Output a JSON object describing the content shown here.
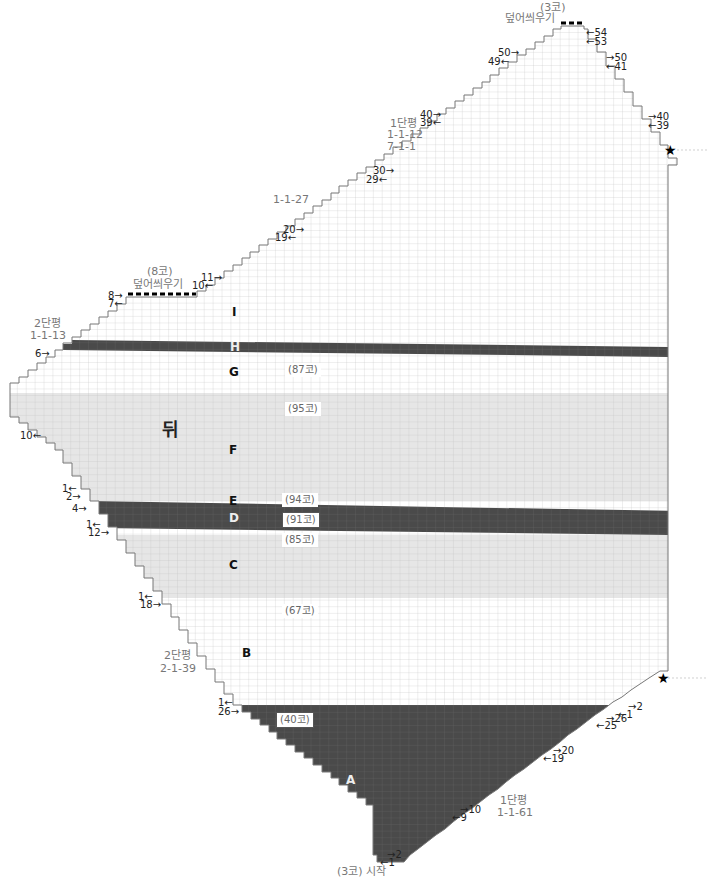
{
  "title": "뒤",
  "chart_data": {
    "type": "knitting-chart",
    "piece": "뒤",
    "start": "(3코) 시작",
    "sections": [
      {
        "id": "A",
        "stitches": "(40코)",
        "color": "#4a4a4a"
      },
      {
        "id": "B",
        "stitches": "(67코)",
        "color": "#ffffff"
      },
      {
        "id": "C",
        "stitches": "(85코)",
        "color": "#e8e8e8"
      },
      {
        "id": "D",
        "stitches": "(91코)",
        "color": "#4a4a4a"
      },
      {
        "id": "E",
        "stitches": "(94코)",
        "color": "#ffffff"
      },
      {
        "id": "F",
        "stitches": "(95코)",
        "color": "#e8e8e8"
      },
      {
        "id": "G",
        "stitches": "(87코)",
        "color": "#ffffff"
      },
      {
        "id": "H",
        "stitches": "",
        "color": "#4a4a4a"
      },
      {
        "id": "I",
        "stitches": "",
        "color": "#ffffff"
      }
    ],
    "shaping_notes": [
      {
        "text": "1단평\n1-1-61",
        "side": "right-bottom"
      },
      {
        "text": "2단평\n2-1-39",
        "side": "left-lower"
      },
      {
        "text": "2단평\n1-1-13",
        "side": "left-upper"
      },
      {
        "text": "1-1-27",
        "side": "top-left-slope"
      },
      {
        "text": "1단평\n1-1-12\n7-1-1",
        "side": "top-right-slope"
      },
      {
        "text": "(8코)\n덮어씌우기",
        "side": "bind-off-left"
      },
      {
        "text": "(3코)\n덮어씌우기",
        "side": "bind-off-top"
      }
    ]
  },
  "labels": {
    "title": "뒤",
    "start": "(3코) 시작",
    "bind_top_1": "(3코)",
    "bind_top_2": "덮어씌우기",
    "bind_left_1": "(8코)",
    "bind_left_2": "덮어씌우기",
    "note_top_right_1": "1단평",
    "note_top_right_2": "1-1-12",
    "note_top_right_3": "7-1-1",
    "note_top_left": "1-1-27",
    "note_left_upper_1": "2단평",
    "note_left_upper_2": "1-1-13",
    "note_left_lower_1": "2단평",
    "note_left_lower_2": "2-1-39",
    "note_right_bottom_1": "1단평",
    "note_right_bottom_2": "1-1-61",
    "sec_A": "A",
    "sec_B": "B",
    "sec_C": "C",
    "sec_D": "D",
    "sec_E": "E",
    "sec_F": "F",
    "sec_G": "G",
    "sec_H": "H",
    "sec_I": "I",
    "st_87": "(87코)",
    "st_95": "(95코)",
    "st_94": "(94코)",
    "st_91": "(91코)",
    "st_85": "(85코)",
    "st_67": "(67코)",
    "st_40": "(40코)",
    "star": "★"
  },
  "row_markers": [
    {
      "text": "←54",
      "x": 586,
      "y": 28
    },
    {
      "text": "←53",
      "x": 586,
      "y": 37
    },
    {
      "text": "→50",
      "x": 606,
      "y": 53
    },
    {
      "text": "←41",
      "x": 606,
      "y": 62
    },
    {
      "text": "→40",
      "x": 648,
      "y": 112
    },
    {
      "text": "←39",
      "x": 648,
      "y": 121
    },
    {
      "text": "50→",
      "x": 498,
      "y": 48
    },
    {
      "text": "49←",
      "x": 488,
      "y": 57
    },
    {
      "text": "40→",
      "x": 420,
      "y": 110
    },
    {
      "text": "39←",
      "x": 420,
      "y": 118
    },
    {
      "text": "30→",
      "x": 373,
      "y": 166
    },
    {
      "text": "29←",
      "x": 366,
      "y": 175
    },
    {
      "text": "20→",
      "x": 283,
      "y": 225
    },
    {
      "text": "19←",
      "x": 275,
      "y": 233
    },
    {
      "text": "11→",
      "x": 201,
      "y": 273
    },
    {
      "text": "10←",
      "x": 192,
      "y": 281
    },
    {
      "text": "8→",
      "x": 108,
      "y": 291
    },
    {
      "text": "7←",
      "x": 108,
      "y": 299
    },
    {
      "text": "6→",
      "x": 35,
      "y": 349
    },
    {
      "text": "10←",
      "x": 20,
      "y": 431
    },
    {
      "text": "1←",
      "x": 62,
      "y": 484
    },
    {
      "text": "2→",
      "x": 66,
      "y": 492
    },
    {
      "text": "4→",
      "x": 72,
      "y": 504
    },
    {
      "text": "1←",
      "x": 86,
      "y": 520
    },
    {
      "text": "12→",
      "x": 88,
      "y": 528
    },
    {
      "text": "1←",
      "x": 138,
      "y": 592
    },
    {
      "text": "18→",
      "x": 140,
      "y": 600
    },
    {
      "text": "1←",
      "x": 218,
      "y": 698
    },
    {
      "text": "26→",
      "x": 218,
      "y": 707
    },
    {
      "text": "→2",
      "x": 628,
      "y": 702
    },
    {
      "text": "←1",
      "x": 618,
      "y": 710
    },
    {
      "text": "→26",
      "x": 606,
      "y": 714
    },
    {
      "text": "←25",
      "x": 596,
      "y": 721
    },
    {
      "text": "→20",
      "x": 553,
      "y": 746
    },
    {
      "text": "←19",
      "x": 543,
      "y": 754
    },
    {
      "text": "→10",
      "x": 460,
      "y": 805
    },
    {
      "text": "←9",
      "x": 452,
      "y": 813
    },
    {
      "text": "→2",
      "x": 387,
      "y": 850
    },
    {
      "text": "←1",
      "x": 380,
      "y": 858
    }
  ]
}
